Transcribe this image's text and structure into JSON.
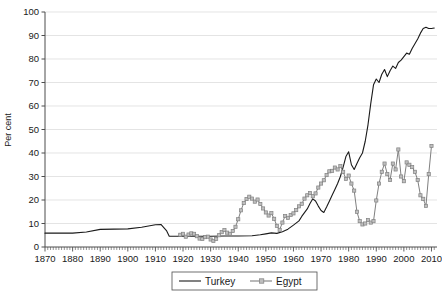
{
  "chart_data": {
    "type": "line",
    "title": "",
    "xlabel": "",
    "ylabel": "Per cent",
    "xlim": [
      1870,
      2012
    ],
    "ylim": [
      0,
      100
    ],
    "grid": true,
    "grid_axis": "y",
    "legend_position": "bottom-center",
    "xticks": [
      1870,
      1880,
      1890,
      1900,
      1910,
      1920,
      1930,
      1940,
      1950,
      1960,
      1970,
      1980,
      1990,
      2000,
      2010
    ],
    "yticks": [
      0,
      10,
      20,
      30,
      40,
      50,
      60,
      70,
      80,
      90,
      100
    ],
    "minor_xticks_interval": 1,
    "series": [
      {
        "name": "Turkey",
        "color": "#1a1a1a",
        "marker": "none",
        "linewidth": 1.1,
        "points": [
          [
            1870,
            5.9
          ],
          [
            1875,
            5.9
          ],
          [
            1880,
            5.9
          ],
          [
            1885,
            6.4
          ],
          [
            1890,
            7.5
          ],
          [
            1895,
            7.6
          ],
          [
            1900,
            7.7
          ],
          [
            1905,
            8.4
          ],
          [
            1910,
            9.5
          ],
          [
            1912,
            9.6
          ],
          [
            1914,
            7.0
          ],
          [
            1915,
            4.6
          ],
          [
            1918,
            4.6
          ],
          [
            1920,
            4.6
          ],
          [
            1925,
            4.6
          ],
          [
            1930,
            4.6
          ],
          [
            1935,
            4.7
          ],
          [
            1940,
            4.7
          ],
          [
            1945,
            4.8
          ],
          [
            1948,
            5.2
          ],
          [
            1950,
            5.6
          ],
          [
            1952,
            6.0
          ],
          [
            1954,
            5.8
          ],
          [
            1956,
            6.5
          ],
          [
            1958,
            7.6
          ],
          [
            1960,
            9.3
          ],
          [
            1962,
            11.1
          ],
          [
            1963,
            13.0
          ],
          [
            1964,
            14.6
          ],
          [
            1965,
            16.2
          ],
          [
            1966,
            18.5
          ],
          [
            1967,
            20.5
          ],
          [
            1968,
            19.6
          ],
          [
            1969,
            17.4
          ],
          [
            1970,
            15.5
          ],
          [
            1971,
            14.7
          ],
          [
            1972,
            17.0
          ],
          [
            1973,
            19.5
          ],
          [
            1974,
            22.0
          ],
          [
            1975,
            24.5
          ],
          [
            1976,
            27.0
          ],
          [
            1977,
            30.0
          ],
          [
            1978,
            34.0
          ],
          [
            1979,
            38.5
          ],
          [
            1980,
            40.5
          ],
          [
            1981,
            35.0
          ],
          [
            1982,
            33.0
          ],
          [
            1983,
            35.5
          ],
          [
            1984,
            38.0
          ],
          [
            1985,
            40.0
          ],
          [
            1986,
            45.0
          ],
          [
            1987,
            52.0
          ],
          [
            1988,
            61.0
          ],
          [
            1989,
            69.0
          ],
          [
            1990,
            71.5
          ],
          [
            1991,
            70.0
          ],
          [
            1992,
            73.5
          ],
          [
            1993,
            75.5
          ],
          [
            1994,
            72.5
          ],
          [
            1995,
            75.0
          ],
          [
            1996,
            77.0
          ],
          [
            1997,
            76.0
          ],
          [
            1998,
            78.5
          ],
          [
            1999,
            79.5
          ],
          [
            2000,
            81.0
          ],
          [
            2001,
            82.5
          ],
          [
            2002,
            82.0
          ],
          [
            2003,
            84.5
          ],
          [
            2004,
            86.5
          ],
          [
            2005,
            88.5
          ],
          [
            2006,
            91.0
          ],
          [
            2007,
            93.0
          ],
          [
            2008,
            93.5
          ],
          [
            2009,
            93.0
          ],
          [
            2010,
            93.0
          ],
          [
            2011,
            93.2
          ]
        ]
      },
      {
        "name": "Egypt",
        "color": "#808080",
        "marker": "square",
        "marker_size": 3.2,
        "linewidth": 1.0,
        "points": [
          [
            1919,
            5.2
          ],
          [
            1920,
            5.6
          ],
          [
            1921,
            4.4
          ],
          [
            1922,
            5.3
          ],
          [
            1923,
            5.8
          ],
          [
            1924,
            5.6
          ],
          [
            1925,
            4.6
          ],
          [
            1926,
            3.6
          ],
          [
            1927,
            3.4
          ],
          [
            1928,
            4.2
          ],
          [
            1929,
            4.4
          ],
          [
            1930,
            3.2
          ],
          [
            1931,
            2.6
          ],
          [
            1932,
            3.4
          ],
          [
            1933,
            5.0
          ],
          [
            1934,
            6.3
          ],
          [
            1935,
            7.2
          ],
          [
            1936,
            6.1
          ],
          [
            1937,
            5.6
          ],
          [
            1938,
            6.8
          ],
          [
            1939,
            8.6
          ],
          [
            1940,
            11.8
          ],
          [
            1941,
            15.6
          ],
          [
            1942,
            18.7
          ],
          [
            1943,
            20.4
          ],
          [
            1944,
            21.4
          ],
          [
            1945,
            20.6
          ],
          [
            1946,
            19.3
          ],
          [
            1947,
            20.2
          ],
          [
            1948,
            18.3
          ],
          [
            1949,
            16.4
          ],
          [
            1950,
            14.7
          ],
          [
            1951,
            13.4
          ],
          [
            1952,
            14.4
          ],
          [
            1953,
            12.0
          ],
          [
            1954,
            9.0
          ],
          [
            1955,
            7.3
          ],
          [
            1956,
            10.4
          ],
          [
            1957,
            13.2
          ],
          [
            1958,
            12.4
          ],
          [
            1959,
            13.6
          ],
          [
            1960,
            14.3
          ],
          [
            1961,
            15.7
          ],
          [
            1962,
            17.3
          ],
          [
            1963,
            18.4
          ],
          [
            1964,
            20.6
          ],
          [
            1965,
            22.0
          ],
          [
            1966,
            23.0
          ],
          [
            1967,
            21.6
          ],
          [
            1968,
            22.8
          ],
          [
            1969,
            25.3
          ],
          [
            1970,
            27.0
          ],
          [
            1971,
            28.4
          ],
          [
            1972,
            30.6
          ],
          [
            1973,
            32.2
          ],
          [
            1974,
            32.4
          ],
          [
            1975,
            33.8
          ],
          [
            1976,
            33.0
          ],
          [
            1977,
            34.4
          ],
          [
            1978,
            32.0
          ],
          [
            1979,
            29.0
          ],
          [
            1980,
            30.4
          ],
          [
            1981,
            27.0
          ],
          [
            1982,
            24.0
          ],
          [
            1983,
            15.0
          ],
          [
            1984,
            11.0
          ],
          [
            1985,
            9.6
          ],
          [
            1986,
            10.0
          ],
          [
            1987,
            11.5
          ],
          [
            1988,
            10.4
          ],
          [
            1989,
            11.0
          ],
          [
            1990,
            19.8
          ],
          [
            1991,
            27.0
          ],
          [
            1992,
            32.0
          ],
          [
            1993,
            35.5
          ],
          [
            1994,
            31.0
          ],
          [
            1995,
            28.5
          ],
          [
            1996,
            35.5
          ],
          [
            1997,
            33.0
          ],
          [
            1998,
            41.5
          ],
          [
            1999,
            30.0
          ],
          [
            2000,
            28.0
          ],
          [
            2001,
            36.0
          ],
          [
            2002,
            35.0
          ],
          [
            2003,
            34.0
          ],
          [
            2004,
            32.0
          ],
          [
            2005,
            28.5
          ],
          [
            2006,
            22.0
          ],
          [
            2007,
            20.5
          ],
          [
            2008,
            17.5
          ],
          [
            2009,
            31.0
          ],
          [
            2010,
            43.0
          ]
        ]
      }
    ],
    "legend": [
      {
        "label": "Turkey",
        "style": "line",
        "color": "#1a1a1a"
      },
      {
        "label": "Egypt",
        "style": "line-marker",
        "color": "#808080"
      }
    ]
  },
  "axes": {
    "ylabel": "Per cent",
    "ytick_labels": [
      "0",
      "10",
      "20",
      "30",
      "40",
      "50",
      "60",
      "70",
      "80",
      "90",
      "100"
    ],
    "xtick_labels": [
      "1870",
      "1880",
      "1890",
      "1900",
      "1910",
      "1920",
      "1930",
      "1940",
      "1950",
      "1960",
      "1970",
      "1980",
      "1990",
      "2000",
      "2010"
    ]
  },
  "legend": {
    "items": [
      {
        "label": "Turkey"
      },
      {
        "label": "Egypt"
      }
    ]
  },
  "colors": {
    "turkey": "#1a1a1a",
    "egypt": "#808080",
    "grid": "#d9d9d9",
    "axis": "#4d4d4d",
    "text": "#1a1a1a",
    "background": "#ffffff"
  }
}
